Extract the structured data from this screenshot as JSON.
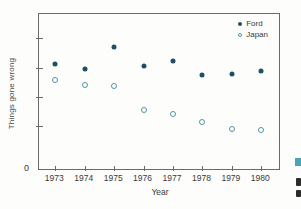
{
  "chart_data": {
    "type": "scatter",
    "title": "",
    "xlabel": "Year",
    "ylabel": "Things gone wrong",
    "categories": [
      "1973",
      "1974",
      "1975",
      "1976",
      "1977",
      "1978",
      "1979",
      "1980"
    ],
    "series": [
      {
        "name": "Ford",
        "marker": "filled-circle",
        "color": "#1e4f63",
        "values": [
          6.8,
          6.5,
          7.9,
          6.7,
          7.0,
          6.1,
          6.2,
          6.4
        ]
      },
      {
        "name": "Japan",
        "marker": "open-circle",
        "color": "#4f93a6",
        "values": [
          5.8,
          5.5,
          5.4,
          3.9,
          3.6,
          3.1,
          2.7,
          2.6
        ]
      }
    ],
    "ylim": [
      0,
      10
    ],
    "y_axis_units": "arbitrary (unlabeled ticks)",
    "ytick_values_unlabeled": [
      2.9,
      4.7,
      6.6,
      8.5
    ],
    "y_origin_label": "0",
    "grid": false,
    "legend_position": "top-right-inside"
  },
  "labels": {
    "ylabel": "Things gone wrong",
    "xlabel": "Year",
    "zero": "0"
  },
  "colors": {
    "background": "#fdfdfb",
    "axis": "#6a6a6a",
    "text": "#3a3a3a",
    "ford_dot": "#1e4f63",
    "japan_ring": "#4f93a6",
    "caption_marker_teal": "#4aa4b8",
    "caption_fragment_dark": "#2b2b2b"
  }
}
